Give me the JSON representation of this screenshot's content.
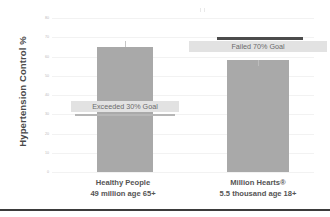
{
  "chart_data": {
    "type": "bar",
    "title": "",
    "xlabel": "",
    "ylabel": "Hypertension Control %",
    "ylim": [
      0,
      80
    ],
    "grid": true,
    "legend": false,
    "categories": [
      "Healthy People",
      "Million Hearts®"
    ],
    "category_sublabels": [
      "49 million age 65+",
      "5.5 thousand age  18+"
    ],
    "values": [
      65,
      58
    ],
    "error_bars": [
      3,
      0
    ],
    "ytick_labels": [
      "80",
      "70",
      "60",
      "50",
      "40",
      "30",
      "20",
      "10",
      "0"
    ],
    "ytick_values": [
      80,
      70,
      60,
      50,
      40,
      30,
      20,
      10,
      0
    ],
    "annotations": [
      {
        "name": "exceeded-30-goal",
        "text": "Exceeded 30% Goal",
        "goal_value": 30,
        "goal_line_style": "light",
        "attached_to": "Healthy People"
      },
      {
        "name": "failed-70-goal",
        "text": "Failed 70% Goal",
        "goal_value": 70,
        "goal_line_style": "dark",
        "attached_to": "Million Hearts®"
      }
    ],
    "colors": {
      "bar": "#a9a9a9",
      "goal_line_light": "#b6b6b6",
      "goal_line_dark": "#4c4c4c",
      "callout_background": "#e2e2e2",
      "callout_text": "#6a6a6a",
      "axis_text": "#b9b9b9",
      "label_text": "#555555",
      "gridline": "#f2f2f2",
      "background": "#ffffff",
      "bottom_rule": "#3b3b3b"
    }
  },
  "axis": {
    "y_title": "Hypertension Control %",
    "ticks": [
      {
        "label": "80"
      },
      {
        "label": "70"
      },
      {
        "label": "60"
      },
      {
        "label": "50"
      },
      {
        "label": "40"
      },
      {
        "label": "30"
      },
      {
        "label": "20"
      },
      {
        "label": "10"
      },
      {
        "label": "0"
      }
    ]
  },
  "series": [
    {
      "name": "Healthy People",
      "sublabel": "49 million age 65+",
      "value": 65,
      "callout": "Exceeded 30% Goal"
    },
    {
      "name": "Million Hearts®",
      "sublabel": "5.5 thousand age  18+",
      "value": 58,
      "callout": "Failed 70% Goal"
    }
  ]
}
